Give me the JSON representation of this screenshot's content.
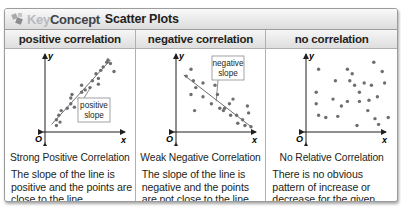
{
  "header": {
    "key_label": "Key",
    "concept_label": "Concept",
    "title": "Scatter Plots",
    "icon": "key-concept-icon"
  },
  "columns": [
    {
      "heading": "positive correlation",
      "subtitle": "Strong Positive Correlation",
      "description": "The slope of the line is positive and the points are close to the line.",
      "callout": [
        "positive",
        "slope"
      ]
    },
    {
      "heading": "negative correlation",
      "subtitle": "Weak Negative Correlation",
      "description": "The slope of the line is negative and the points are not close to the line.",
      "callout": [
        "negative",
        "slope"
      ]
    },
    {
      "heading": "no correlation",
      "subtitle": "No Relative Correlation",
      "description": "There is no obvious pattern of increase or decrease for the given data.",
      "callout": null
    }
  ],
  "axis_labels": {
    "x": "x",
    "y": "y",
    "origin": "O"
  },
  "colors": {
    "dot": "#6d6e71",
    "axis": "#231f20",
    "line": "#6d6e71",
    "header_gradient_top": "#fafafa",
    "header_gradient_bottom": "#dcdcdc",
    "key_text": "#b7b9bf",
    "concept_text": "#3e4349"
  },
  "chart_data": [
    {
      "type": "scatter",
      "title": "positive correlation",
      "xlabel": "x",
      "ylabel": "y",
      "trend": "positive",
      "trendline": [
        [
          3,
          4
        ],
        [
          52,
          60
        ]
      ],
      "points": [
        [
          7,
          3
        ],
        [
          7,
          8
        ],
        [
          9,
          12
        ],
        [
          10,
          6
        ],
        [
          11,
          16
        ],
        [
          16,
          18
        ],
        [
          19,
          22
        ],
        [
          19,
          27
        ],
        [
          20,
          30
        ],
        [
          22,
          19
        ],
        [
          26,
          26
        ],
        [
          28,
          32
        ],
        [
          28,
          38
        ],
        [
          31,
          34
        ],
        [
          35,
          36
        ],
        [
          37,
          42
        ],
        [
          40,
          48
        ],
        [
          42,
          44
        ],
        [
          44,
          51
        ],
        [
          46,
          54
        ],
        [
          49,
          58
        ],
        [
          50,
          60
        ],
        [
          52,
          57
        ],
        [
          55,
          50
        ],
        [
          42,
          39
        ],
        [
          36,
          23
        ]
      ]
    },
    {
      "type": "scatter",
      "title": "negative correlation",
      "xlabel": "x",
      "ylabel": "y",
      "trend": "negative",
      "trendline": [
        [
          4,
          47
        ],
        [
          60,
          2
        ]
      ],
      "points": [
        [
          6,
          46
        ],
        [
          10,
          52
        ],
        [
          12,
          42
        ],
        [
          14,
          36
        ],
        [
          10,
          30
        ],
        [
          13,
          16
        ],
        [
          20,
          40
        ],
        [
          20,
          28
        ],
        [
          27,
          22
        ],
        [
          30,
          38
        ],
        [
          32,
          30
        ],
        [
          34,
          18
        ],
        [
          37,
          16
        ],
        [
          38,
          18
        ],
        [
          42,
          22
        ],
        [
          45,
          26
        ],
        [
          48,
          12
        ],
        [
          49,
          5
        ],
        [
          53,
          8
        ],
        [
          55,
          3
        ],
        [
          58,
          14
        ],
        [
          60,
          2
        ],
        [
          57,
          20
        ],
        [
          43,
          12
        ]
      ]
    },
    {
      "type": "scatter",
      "title": "no correlation",
      "xlabel": "x",
      "ylabel": "y",
      "trend": "none",
      "trendline": null,
      "points": [
        [
          8,
          52
        ],
        [
          6,
          32
        ],
        [
          6,
          22
        ],
        [
          8,
          12
        ],
        [
          14,
          10
        ],
        [
          20,
          26
        ],
        [
          22,
          42
        ],
        [
          24,
          11
        ],
        [
          27,
          20
        ],
        [
          32,
          24
        ],
        [
          32,
          52
        ],
        [
          34,
          42
        ],
        [
          36,
          48
        ],
        [
          38,
          38
        ],
        [
          40,
          3
        ],
        [
          42,
          32
        ],
        [
          42,
          24
        ],
        [
          46,
          40
        ],
        [
          49,
          16
        ],
        [
          50,
          25
        ],
        [
          52,
          38
        ],
        [
          54,
          58
        ],
        [
          55,
          9
        ],
        [
          57,
          28
        ],
        [
          58,
          4
        ],
        [
          61,
          50
        ],
        [
          63,
          40
        ],
        [
          66,
          10
        ]
      ]
    }
  ]
}
